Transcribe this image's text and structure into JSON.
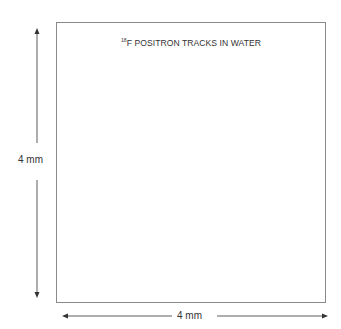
{
  "figure": {
    "title_superscript": "18",
    "title_text": "F POSITRON TRACKS IN WATER",
    "vertical_dimension_label": "4 mm",
    "horizontal_dimension_label": "4 mm",
    "colors": {
      "frame": "#8a8a8a",
      "tracks": "#222222",
      "text": "#333333",
      "arrows": "#333333"
    }
  }
}
